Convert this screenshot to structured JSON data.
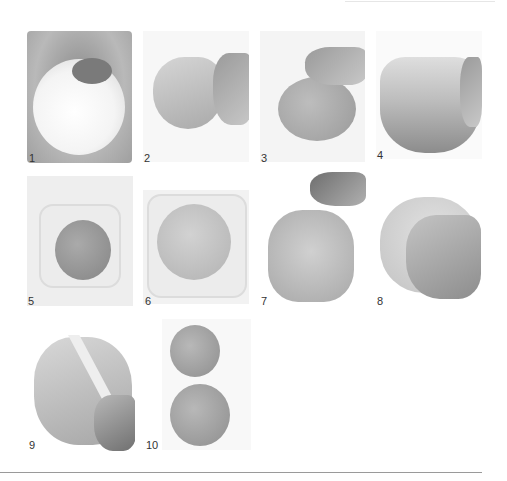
{
  "page": {
    "type": "step-by-step photo instructions"
  },
  "steps": [
    {
      "number": "1",
      "image": "flour-and-yeast-in-bowl-photo"
    },
    {
      "number": "2",
      "image": "hand-pulling-shaggy-dough-photo"
    },
    {
      "number": "3",
      "image": "hand-kneading-dough-photo"
    },
    {
      "number": "4",
      "image": "hand-folding-dough-photo"
    },
    {
      "number": "5",
      "image": "dough-ball-in-plastic-tub-photo"
    },
    {
      "number": "6",
      "image": "risen-dough-in-plastic-tub-photo"
    },
    {
      "number": "7",
      "image": "sprinkling-flour-on-dough-photo"
    },
    {
      "number": "8",
      "image": "hand-pressing-dough-photo"
    },
    {
      "number": "9",
      "image": "knife-cutting-dough-photo"
    },
    {
      "number": "10",
      "image": "two-dough-balls-photo"
    }
  ]
}
